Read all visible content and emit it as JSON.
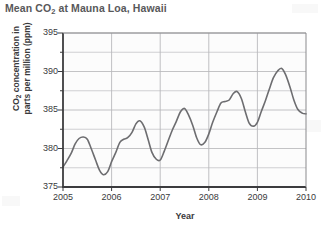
{
  "chart_data": {
    "type": "line",
    "title": "Mean CO2 at Mauna Loa, Hawaii",
    "title_main": "Mean CO",
    "title_sub": "2",
    "title_rest": " at Mauna Loa, Hawaii",
    "xlabel": "Year",
    "ylabel": "CO2 concentration in parts per million (ppm)",
    "ylabel_line1_main": "CO",
    "ylabel_line1_sub": "2",
    "ylabel_line1_rest": " concentration in",
    "ylabel_line2": "parts per million (ppm)",
    "ylim": [
      375,
      395
    ],
    "xlim": [
      2005,
      2010
    ],
    "yticks": [
      375,
      380,
      385,
      390,
      395
    ],
    "ytick_labels": [
      "375",
      "380",
      "385",
      "390",
      "395"
    ],
    "y_minor_step": 2.5,
    "xticks": [
      2005,
      2006,
      2007,
      2008,
      2009,
      2010
    ],
    "xtick_labels": [
      "2005",
      "2006",
      "2007",
      "2008",
      "2009",
      "2010"
    ],
    "grid": true,
    "legend": "none",
    "line_color": "#6d6d70",
    "grid_color": "#b9b9bc",
    "axis_color": "#3c3c3e",
    "series": [
      {
        "name": "Mean CO2 concentration",
        "points": [
          [
            2005.0,
            377.6
          ],
          [
            2005.08,
            378.4
          ],
          [
            2005.17,
            379.4
          ],
          [
            2005.25,
            380.6
          ],
          [
            2005.33,
            381.3
          ],
          [
            2005.42,
            381.5
          ],
          [
            2005.5,
            381.2
          ],
          [
            2005.58,
            380.0
          ],
          [
            2005.67,
            378.5
          ],
          [
            2005.75,
            377.2
          ],
          [
            2005.83,
            376.6
          ],
          [
            2005.92,
            377.0
          ],
          [
            2006.0,
            378.3
          ],
          [
            2006.08,
            379.4
          ],
          [
            2006.17,
            380.8
          ],
          [
            2006.25,
            381.2
          ],
          [
            2006.33,
            381.4
          ],
          [
            2006.42,
            382.1
          ],
          [
            2006.5,
            383.2
          ],
          [
            2006.58,
            383.6
          ],
          [
            2006.67,
            382.8
          ],
          [
            2006.75,
            381.2
          ],
          [
            2006.83,
            379.5
          ],
          [
            2006.92,
            378.6
          ],
          [
            2007.0,
            378.5
          ],
          [
            2007.08,
            379.6
          ],
          [
            2007.17,
            381.1
          ],
          [
            2007.25,
            382.4
          ],
          [
            2007.33,
            383.5
          ],
          [
            2007.42,
            384.8
          ],
          [
            2007.5,
            385.2
          ],
          [
            2007.58,
            384.4
          ],
          [
            2007.67,
            383.0
          ],
          [
            2007.75,
            381.4
          ],
          [
            2007.83,
            380.5
          ],
          [
            2007.92,
            380.8
          ],
          [
            2008.0,
            381.9
          ],
          [
            2008.08,
            383.4
          ],
          [
            2008.17,
            384.8
          ],
          [
            2008.25,
            385.9
          ],
          [
            2008.33,
            386.1
          ],
          [
            2008.42,
            386.3
          ],
          [
            2008.5,
            387.1
          ],
          [
            2008.58,
            387.4
          ],
          [
            2008.67,
            386.5
          ],
          [
            2008.75,
            384.8
          ],
          [
            2008.83,
            383.3
          ],
          [
            2008.92,
            382.9
          ],
          [
            2009.0,
            383.4
          ],
          [
            2009.08,
            384.8
          ],
          [
            2009.17,
            386.3
          ],
          [
            2009.25,
            387.8
          ],
          [
            2009.33,
            389.2
          ],
          [
            2009.42,
            390.1
          ],
          [
            2009.5,
            390.4
          ],
          [
            2009.58,
            389.6
          ],
          [
            2009.67,
            388.0
          ],
          [
            2009.75,
            386.3
          ],
          [
            2009.83,
            385.1
          ],
          [
            2009.92,
            384.6
          ],
          [
            2010.0,
            384.5
          ]
        ]
      }
    ]
  }
}
